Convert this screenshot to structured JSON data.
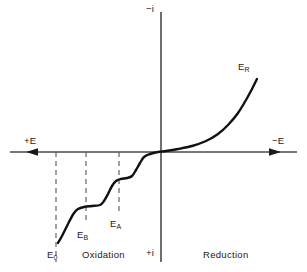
{
  "figure": {
    "type": "polarization-curve-diagram",
    "axes": {
      "vertical_top_label": "−i",
      "vertical_bottom_label": "+i",
      "horizontal_left_label": "+E",
      "horizontal_right_label": "−E",
      "vertical_axis_x": 161,
      "horizontal_axis_y": 152
    },
    "regions": [
      {
        "name": "oxidation",
        "label": "Oxidation",
        "x": 82,
        "y": 252
      },
      {
        "name": "reduction",
        "label": "Reduction",
        "x": 203,
        "y": 252
      }
    ],
    "potential_markers": [
      {
        "id": "E0",
        "base": "E",
        "sub": "0",
        "x_line": 56,
        "label_x": 47,
        "label_y": 250,
        "line_top": 152,
        "line_bottom": 244
      },
      {
        "id": "EB",
        "base": "E",
        "sub": "B",
        "x_line": 86,
        "label_x": 77,
        "label_y": 230,
        "line_top": 152,
        "line_bottom": 224
      },
      {
        "id": "EA",
        "base": "E",
        "sub": "A",
        "x_line": 119,
        "label_x": 110,
        "label_y": 219,
        "line_top": 152,
        "line_bottom": 213
      },
      {
        "id": "ER",
        "base": "E",
        "sub": "R",
        "x_line": null,
        "label_x": 238,
        "label_y": 62,
        "line_top": null,
        "line_bottom": null
      }
    ],
    "colors": {
      "curve": "#111111",
      "axis": "#4a4a4a",
      "dashed": "#555555",
      "text": "#1a1a1a",
      "background": "#ffffff"
    }
  },
  "chart_data": {
    "type": "line",
    "title": "",
    "xlabel": "Potential (E)",
    "ylabel": "Current (i)",
    "xlim": [
      10,
      297
    ],
    "ylim": [
      262,
      12
    ],
    "grid": false,
    "legend": null,
    "annotations": [
      {
        "text": "−i",
        "x": 150,
        "y": 10
      },
      {
        "text": "+i",
        "x": 150,
        "y": 253
      },
      {
        "text": "+E",
        "x": 27,
        "y": 144
      },
      {
        "text": "−E",
        "x": 277,
        "y": 144
      },
      {
        "text": "E₀",
        "x": 47,
        "y": 250
      },
      {
        "text": "E_B",
        "x": 77,
        "y": 230
      },
      {
        "text": "E_A",
        "x": 110,
        "y": 219
      },
      {
        "text": "E_R",
        "x": 238,
        "y": 62
      },
      {
        "text": "Oxidation",
        "x": 82,
        "y": 252
      },
      {
        "text": "Reduction",
        "x": 203,
        "y": 252
      }
    ],
    "series": [
      {
        "name": "polarization-curve",
        "description": "Staircase anodic wave on the oxidation side rising through three steps, passing through the origin, then an exponential cathodic rise on the reduction side.",
        "points": [
          [
            58,
            243
          ],
          [
            62,
            236
          ],
          [
            66,
            228
          ],
          [
            70,
            220
          ],
          [
            74,
            213
          ],
          [
            78,
            209
          ],
          [
            84,
            207
          ],
          [
            92,
            206
          ],
          [
            100,
            205
          ],
          [
            104,
            201
          ],
          [
            108,
            194
          ],
          [
            112,
            186
          ],
          [
            116,
            181
          ],
          [
            121,
            179
          ],
          [
            127,
            178
          ],
          [
            132,
            176
          ],
          [
            136,
            170
          ],
          [
            140,
            163
          ],
          [
            144,
            157
          ],
          [
            150,
            154
          ],
          [
            158,
            152
          ],
          [
            166,
            151
          ],
          [
            178,
            149
          ],
          [
            192,
            146
          ],
          [
            206,
            141
          ],
          [
            218,
            134
          ],
          [
            228,
            125
          ],
          [
            238,
            113
          ],
          [
            246,
            100
          ],
          [
            252,
            89
          ],
          [
            257,
            79
          ]
        ]
      }
    ]
  }
}
